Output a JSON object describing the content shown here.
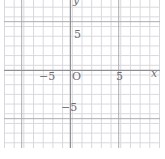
{
  "chart_data": {
    "type": "scatter",
    "title": "",
    "subtitle": "",
    "xlabel": "x",
    "ylabel": "y",
    "xlim": [
      -7,
      9
    ],
    "ylim": [
      -8,
      7
    ],
    "xticks": [
      -5,
      0,
      5
    ],
    "yticks": [
      -5,
      5
    ],
    "xticklabels": [
      "−5",
      "O",
      "5"
    ],
    "yticklabels": [
      "−5",
      "5"
    ],
    "grid": true,
    "grid_minor": true,
    "minor_step": 1,
    "major_step": 5,
    "legend": null,
    "series": [],
    "annotations": [],
    "origin_label": "O"
  },
  "axes": {
    "y_axis_label": "y",
    "x_axis_label": "x",
    "origin_label": "O",
    "y_tick_positive": "5",
    "y_tick_negative": "−5",
    "x_tick_negative": "−5",
    "x_tick_positive": "5"
  },
  "colors": {
    "background": "#ffffff",
    "grid_minor": "#d8d8dc",
    "grid_major": "#a9a9af",
    "axis": "#8e8e95",
    "label_text": "#6e6e74"
  }
}
